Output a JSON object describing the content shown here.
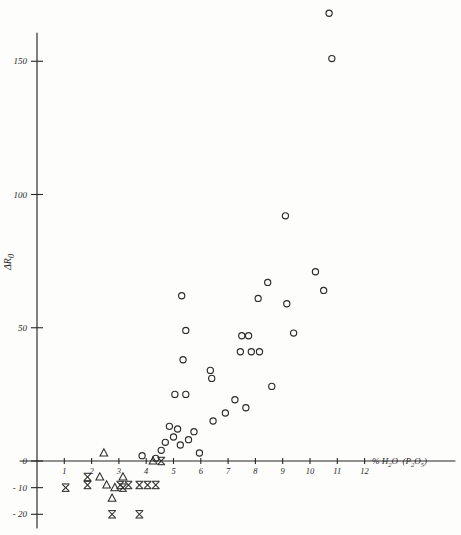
{
  "figure": {
    "title": "",
    "ylabel": "Δ R0",
    "ylabel_delta": "Δ",
    "ylabel_r": "R",
    "ylabel_sub": "0",
    "xlabel_percent": "%",
    "xlabel_h2o": "H",
    "xlabel_h2o_sub": "2",
    "xlabel_h2o_rest": "O",
    "xlabel_paren_open": "(",
    "xlabel_p": "P",
    "xlabel_p_sub": "2",
    "xlabel_o": "O",
    "xlabel_o_sub": "5",
    "xlabel_paren_close": ")",
    "background_color": "#fdfdfc",
    "ink_color": "#2b2b2b"
  },
  "chart_data": {
    "type": "scatter",
    "title": "",
    "xlabel": "% H2O (P2O5)",
    "ylabel": "Δ R0",
    "xlim": [
      0,
      13.6
    ],
    "ylim": [
      -24,
      185
    ],
    "grid": false,
    "legend": "none",
    "xticks": [
      1,
      2,
      3,
      4,
      5,
      6,
      7,
      8,
      9,
      10,
      11,
      12
    ],
    "xticklabels": [
      "1",
      "2",
      "3",
      "4",
      "5",
      "6",
      "7",
      "8",
      "9",
      "10",
      "11",
      "12"
    ],
    "yticks": [
      -20,
      -10,
      0,
      50,
      100,
      150
    ],
    "yticklabels": [
      "- 20",
      "- 10",
      "0",
      "50",
      "100",
      "150"
    ],
    "series": [
      {
        "name": "circle",
        "marker": "open-circle",
        "points": [
          [
            9.5,
            181
          ],
          [
            10.7,
            168
          ],
          [
            10.8,
            151
          ],
          [
            9.1,
            92
          ],
          [
            10.2,
            71
          ],
          [
            10.5,
            64
          ],
          [
            8.45,
            67
          ],
          [
            8.1,
            61
          ],
          [
            5.3,
            62
          ],
          [
            9.15,
            59
          ],
          [
            9.4,
            48
          ],
          [
            7.5,
            47
          ],
          [
            7.75,
            47
          ],
          [
            7.45,
            41
          ],
          [
            7.85,
            41
          ],
          [
            5.45,
            49
          ],
          [
            8.15,
            41
          ],
          [
            5.35,
            38
          ],
          [
            6.35,
            34
          ],
          [
            6.4,
            31
          ],
          [
            8.6,
            28
          ],
          [
            5.05,
            25
          ],
          [
            5.45,
            25
          ],
          [
            7.25,
            23
          ],
          [
            7.65,
            20
          ],
          [
            6.9,
            18
          ],
          [
            6.45,
            15
          ],
          [
            4.85,
            13
          ],
          [
            5.15,
            12
          ],
          [
            5.75,
            11
          ],
          [
            5.0,
            9
          ],
          [
            5.55,
            8
          ],
          [
            4.7,
            7
          ],
          [
            5.25,
            6
          ],
          [
            4.55,
            4
          ],
          [
            5.95,
            3
          ],
          [
            3.85,
            2
          ],
          [
            4.35,
            1
          ]
        ]
      },
      {
        "name": "triangle",
        "marker": "open-triangle-up",
        "points": [
          [
            2.45,
            3
          ],
          [
            4.25,
            0
          ],
          [
            2.3,
            -6
          ],
          [
            3.15,
            -6
          ],
          [
            2.55,
            -9
          ],
          [
            2.85,
            -10
          ],
          [
            2.75,
            -14
          ]
        ]
      },
      {
        "name": "x-barred",
        "marker": "x-with-bars",
        "points": [
          [
            4.55,
            0
          ],
          [
            1.85,
            -6
          ],
          [
            1.85,
            -9
          ],
          [
            3.05,
            -9
          ],
          [
            3.35,
            -9
          ],
          [
            3.75,
            -9
          ],
          [
            4.05,
            -9
          ],
          [
            4.35,
            -9
          ],
          [
            1.05,
            -10
          ],
          [
            3.15,
            -10
          ],
          [
            2.75,
            -20
          ],
          [
            3.75,
            -20
          ]
        ]
      }
    ]
  },
  "axes": {
    "x_axis_name": "x-axis",
    "y_axis_name": "y-axis"
  }
}
